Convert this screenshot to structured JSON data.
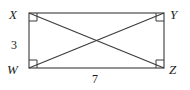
{
  "figure": {
    "kind": "geometry-diagram",
    "shape": "rectangle-with-diagonals",
    "stroke_color": "#3a3a3a",
    "background_color": "#ffffff",
    "vertices": [
      {
        "name": "X",
        "label": "X",
        "position": "top-left",
        "x": 29,
        "y": 13
      },
      {
        "name": "Y",
        "label": "Y",
        "position": "top-right",
        "x": 164,
        "y": 13
      },
      {
        "name": "W",
        "label": "W",
        "position": "bottom-left",
        "x": 29,
        "y": 68
      },
      {
        "name": "Z",
        "label": "Z",
        "position": "bottom-right",
        "x": 164,
        "y": 68
      }
    ],
    "right_angle_markers": [
      "X",
      "Y",
      "W",
      "Z"
    ],
    "diagonals": [
      "X-Z",
      "W-Y"
    ],
    "measurements": [
      {
        "name": "left-side",
        "edge": "X-W",
        "value": "3"
      },
      {
        "name": "bottom-side",
        "edge": "W-Z",
        "value": "7"
      }
    ]
  }
}
